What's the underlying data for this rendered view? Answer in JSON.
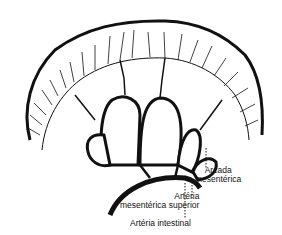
{
  "diagram": {
    "labels": {
      "arcada_line1": "Arcada",
      "arcada_line2": "mesentérica",
      "ams_line1": "Artéria",
      "ams_line2": "mesentérica superior",
      "intestinal": "Artéria intestinal"
    },
    "colors": {
      "ink": "#111111",
      "background": "#ffffff"
    }
  }
}
